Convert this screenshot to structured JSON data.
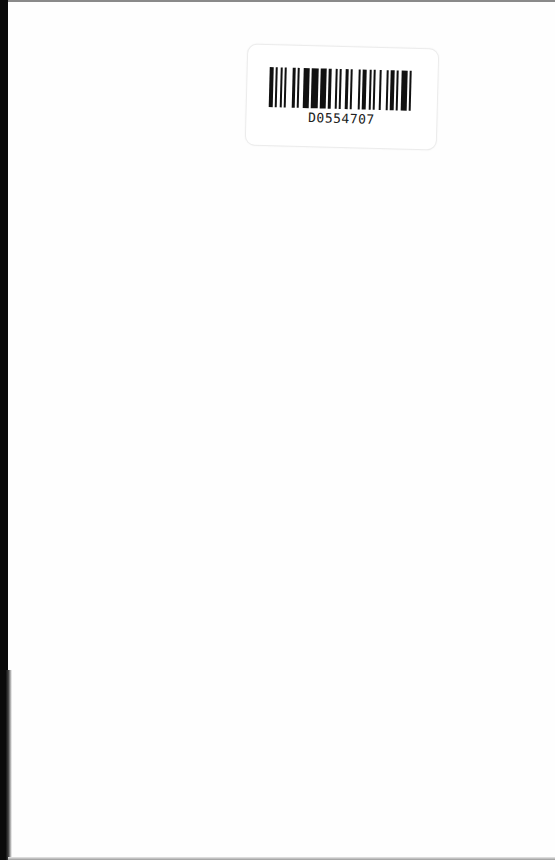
{
  "page": {
    "type": "scanned-book-page",
    "content": "blank"
  },
  "barcode_label": {
    "code": "D0554707",
    "bars": [
      2,
      1,
      1,
      2,
      1,
      1,
      1,
      3,
      2,
      1,
      1,
      2,
      3,
      1,
      4,
      1,
      3,
      1,
      2,
      2,
      1,
      1,
      1,
      2,
      2,
      1,
      1,
      3,
      1,
      1,
      2,
      2,
      1,
      1,
      1,
      2,
      1,
      3,
      1,
      1,
      2,
      1,
      1,
      2,
      3,
      1,
      1,
      2
    ]
  }
}
